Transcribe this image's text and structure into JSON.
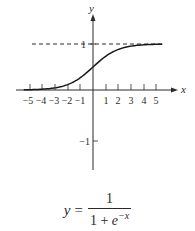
{
  "chart_data": {
    "type": "line",
    "title": "",
    "xlabel": "x",
    "ylabel": "y",
    "function": "y = 1/(1 + e^(-x))",
    "x_ticks": [
      -5,
      -4,
      -3,
      -2,
      -1,
      1,
      2,
      3,
      4,
      5
    ],
    "x_tick_labels": [
      "−5",
      "−4",
      "−3",
      "−2",
      "−1",
      "1",
      "2",
      "3",
      "4",
      "5"
    ],
    "y_ticks": [
      1,
      -1
    ],
    "y_tick_labels": [
      "1",
      "−1"
    ],
    "xlim": [
      -5.5,
      5.5
    ],
    "ylim": [
      -1.3,
      1.1
    ],
    "asymptote": {
      "y": 1,
      "style": "dashed"
    },
    "series": [
      {
        "name": "sigmoid",
        "x": [
          -5.5,
          -5,
          -4,
          -3,
          -2,
          -1,
          0,
          1,
          2,
          3,
          4,
          5,
          5.5
        ],
        "y": [
          0.004,
          0.007,
          0.018,
          0.047,
          0.119,
          0.269,
          0.5,
          0.731,
          0.881,
          0.953,
          0.982,
          0.993,
          0.996
        ]
      }
    ],
    "grid": false,
    "legend": null
  },
  "axes": {
    "x_label": "x",
    "y_label": "y"
  },
  "formula": {
    "lhs": "y",
    "equals": "=",
    "numerator": "1",
    "denominator_base": "1 + ",
    "denominator_e": "e",
    "denominator_exp": "−x"
  },
  "colors": {
    "ink": "#2a2a2a",
    "background": "#ffffff"
  }
}
